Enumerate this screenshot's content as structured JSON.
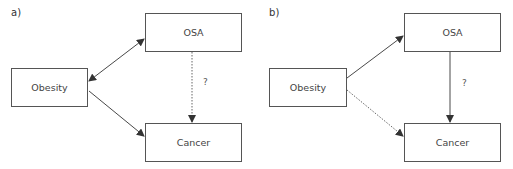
{
  "diagram": {
    "panels": [
      {
        "label": "a)",
        "nodes": {
          "obesity": "Obesity",
          "osa": "OSA",
          "cancer": "Cancer"
        },
        "edges": [
          {
            "from": "Obesity",
            "to": "OSA",
            "style": "solid",
            "direction": "bidirectional"
          },
          {
            "from": "Obesity",
            "to": "Cancer",
            "style": "solid",
            "direction": "forward"
          },
          {
            "from": "OSA",
            "to": "Cancer",
            "style": "dotted",
            "direction": "forward",
            "label": "?"
          }
        ],
        "question_label": "?"
      },
      {
        "label": "b)",
        "nodes": {
          "obesity": "Obesity",
          "osa": "OSA",
          "cancer": "Cancer"
        },
        "edges": [
          {
            "from": "Obesity",
            "to": "OSA",
            "style": "solid",
            "direction": "forward"
          },
          {
            "from": "Obesity",
            "to": "Cancer",
            "style": "dotted",
            "direction": "forward"
          },
          {
            "from": "OSA",
            "to": "Cancer",
            "style": "solid",
            "direction": "forward",
            "label": "?"
          }
        ],
        "question_label": "?"
      }
    ],
    "colors": {
      "line": "#333333",
      "box_border": "#555555",
      "text": "#444444"
    }
  }
}
